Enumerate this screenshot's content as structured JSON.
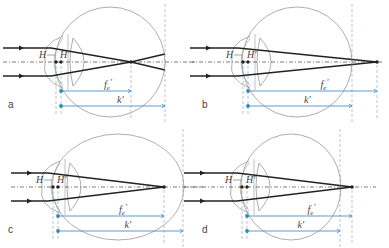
{
  "figure": {
    "colors": {
      "ray": "#222222",
      "outline": "#999999",
      "axis": "#444444",
      "guide": "#8aa0b8",
      "measure": "#4a90c8",
      "marker": "#2a8fb0"
    },
    "labels": {
      "H": "H",
      "H_prime": "H'",
      "focal": "f",
      "focal_sub": "e",
      "focal_prime": "'",
      "axial": "k'"
    },
    "panels": [
      {
        "id": "a",
        "label": "a",
        "ox": 0,
        "oy": 0,
        "eye_cx": 110,
        "eye_cy": 62,
        "eye_rx": 55,
        "eye_ry": 55,
        "focus_x": 131,
        "retina_x": 165,
        "ray_end_x": 165,
        "ray_spread_end": 8
      },
      {
        "id": "b",
        "label": "b",
        "ox": 0,
        "oy": 0,
        "eye_cx": 297,
        "eye_cy": 62,
        "eye_rx": 55,
        "eye_ry": 55,
        "focus_x": 377,
        "retina_x": 352,
        "ray_end_x": 377,
        "ray_spread_end": 0
      },
      {
        "id": "c",
        "label": "c",
        "ox": 0,
        "oy": 0,
        "eye_cx": 118,
        "eye_cy": 187,
        "eye_rx": 66,
        "eye_ry": 53,
        "focus_x": 164,
        "retina_x": 183,
        "ray_end_x": 164,
        "ray_spread_end": 0
      },
      {
        "id": "d",
        "label": "d",
        "ox": 0,
        "oy": 0,
        "eye_cx": 291,
        "eye_cy": 187,
        "eye_rx": 50,
        "eye_ry": 53,
        "focus_x": 352,
        "retina_x": 340,
        "ray_end_x": 352,
        "ray_spread_end": 0
      }
    ]
  }
}
